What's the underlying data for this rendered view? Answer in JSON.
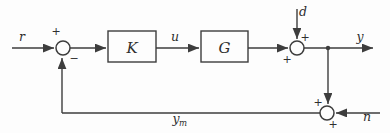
{
  "diagram": {
    "type": "control-system-block-diagram",
    "colors": {
      "background": "#fdfdfd",
      "line": "#3d3d3d",
      "text": "#2e2e2e"
    },
    "blocks": [
      {
        "id": "controller",
        "label": "K",
        "x": 108,
        "y": 31,
        "w": 48,
        "h": 31
      },
      {
        "id": "plant",
        "label": "G",
        "x": 201,
        "y": 31,
        "w": 47,
        "h": 31
      }
    ],
    "summing_junctions": [
      {
        "id": "error-sum",
        "cx": 63,
        "cy": 48,
        "r": 7,
        "signs": [
          {
            "text": "+",
            "x": 56,
            "y": 35
          },
          {
            "text": "−",
            "x": 74,
            "y": 62
          }
        ]
      },
      {
        "id": "disturbance-sum",
        "cx": 297,
        "cy": 48,
        "r": 7,
        "signs": [
          {
            "text": "+",
            "x": 305,
            "y": 41
          },
          {
            "text": "+",
            "x": 286,
            "y": 63
          }
        ]
      },
      {
        "id": "noise-sum",
        "cx": 327,
        "cy": 113,
        "r": 7,
        "signs": [
          {
            "text": "+",
            "x": 317,
            "y": 106
          },
          {
            "text": "+",
            "x": 332,
            "y": 128
          }
        ]
      }
    ],
    "signals": [
      {
        "id": "reference",
        "label": "r",
        "x": 22,
        "y": 41
      },
      {
        "id": "control",
        "label": "u",
        "x": 175,
        "y": 41
      },
      {
        "id": "disturbance",
        "label": "d",
        "x": 303,
        "y": 15
      },
      {
        "id": "output",
        "label": "y",
        "x": 360,
        "y": 41
      },
      {
        "id": "noise",
        "label": "n",
        "x": 366,
        "y": 120
      }
    ],
    "measured_output": {
      "id": "measured-output",
      "base": "y",
      "subscript": "m",
      "x": 176,
      "y": 123
    },
    "tap_nodes": [
      {
        "id": "output-tap",
        "cx": 328,
        "cy": 48,
        "r": 2.2
      }
    ]
  }
}
